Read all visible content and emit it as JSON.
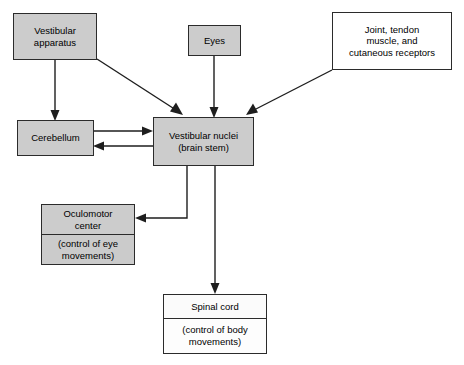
{
  "diagram": {
    "colors": {
      "shaded_box_fill": "#cccccc",
      "plain_box_fill": "#ffffff",
      "border": "#2b2b2b",
      "connector": "#1e1e1e",
      "background": "#ffffff"
    },
    "nodes": {
      "vestibular_apparatus": {
        "label": "Vestibular\napparatus",
        "fill": "shaded"
      },
      "eyes": {
        "label": "Eyes",
        "fill": "shaded"
      },
      "joint_receptors": {
        "label": "Joint, tendon\nmuscle, and\ncutaneous receptors",
        "fill": "plain"
      },
      "cerebellum": {
        "label": "Cerebellum",
        "fill": "shaded"
      },
      "vestibular_nuclei": {
        "label": "Vestibular nuclei\n(brain stem)",
        "fill": "shaded"
      },
      "oculomotor_center": {
        "title": "Oculomotor\ncenter",
        "subtitle": "(control of eye\nmovements)",
        "fill": "shaded"
      },
      "spinal_cord": {
        "title": "Spinal cord",
        "subtitle": "(control of body\nmovements)",
        "fill": "plain"
      }
    },
    "connections": [
      {
        "from": "vestibular_apparatus",
        "to": "cerebellum",
        "style": "straight-down"
      },
      {
        "from": "vestibular_apparatus",
        "to": "vestibular_nuclei",
        "style": "diagonal"
      },
      {
        "from": "eyes",
        "to": "vestibular_nuclei",
        "style": "straight-down"
      },
      {
        "from": "joint_receptors",
        "to": "vestibular_nuclei",
        "style": "diagonal"
      },
      {
        "from": "cerebellum",
        "to": "vestibular_nuclei",
        "style": "horizontal-right"
      },
      {
        "from": "vestibular_nuclei",
        "to": "cerebellum",
        "style": "horizontal-left"
      },
      {
        "from": "vestibular_nuclei",
        "to": "oculomotor_center",
        "style": "elbow-left"
      },
      {
        "from": "vestibular_nuclei",
        "to": "spinal_cord",
        "style": "straight-down"
      }
    ]
  }
}
